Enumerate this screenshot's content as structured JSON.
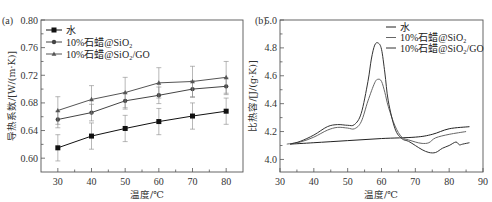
{
  "chart_data": [
    {
      "type": "line",
      "panel_label": "(a)",
      "title": "",
      "xlabel": "温度/℃",
      "ylabel": "导热系数/[W/(m·K)]",
      "xlim": [
        25,
        85
      ],
      "ylim": [
        0.58,
        0.8
      ],
      "x_ticks": [
        30,
        40,
        50,
        60,
        70,
        80
      ],
      "y_ticks": [
        0.6,
        0.64,
        0.68,
        0.72,
        0.76,
        0.8
      ],
      "y_tick_labels": [
        "0.60",
        "0.64",
        "0.68",
        "0.72",
        "0.76",
        "0.80"
      ],
      "legend_position": "top-left",
      "grid": false,
      "x": [
        30,
        40,
        50,
        60,
        70,
        80
      ],
      "series": [
        {
          "name": "水",
          "marker": "square",
          "values": [
            0.615,
            0.632,
            0.643,
            0.653,
            0.661,
            0.668
          ],
          "error": [
            0.019,
            0.019,
            0.019,
            0.019,
            0.019,
            0.019
          ]
        },
        {
          "name": "10%石蜡@SiO₂",
          "marker": "circle",
          "values": [
            0.656,
            0.666,
            0.683,
            0.691,
            0.7,
            0.704
          ],
          "error": [
            0.012,
            0.012,
            0.012,
            0.012,
            0.012,
            0.012
          ]
        },
        {
          "name": "10%石蜡@SiO₂/GO",
          "marker": "triangle",
          "values": [
            0.669,
            0.685,
            0.695,
            0.709,
            0.711,
            0.717
          ],
          "error": [
            0.02,
            0.02,
            0.022,
            0.022,
            0.022,
            0.023
          ]
        }
      ]
    },
    {
      "type": "line",
      "panel_label": "(b)",
      "title": "",
      "xlabel": "温度/℃",
      "ylabel": "比热容/[J/(g·K)]",
      "xlim": [
        30,
        90
      ],
      "ylim": [
        3.91,
        5.0
      ],
      "x_ticks": [
        30,
        40,
        50,
        60,
        70,
        80,
        90
      ],
      "y_ticks": [
        4.0,
        4.2,
        4.4,
        4.6,
        4.8,
        5.0
      ],
      "y_tick_labels": [
        "4.0",
        "4.2",
        "4.4",
        "4.6",
        "4.8",
        "5.0"
      ],
      "legend_position": "top-right",
      "grid": false,
      "series": [
        {
          "name": "水",
          "x": [
            33,
            40,
            50,
            60,
            70,
            75,
            80,
            86
          ],
          "values": [
            4.11,
            4.12,
            4.135,
            4.15,
            4.16,
            4.18,
            4.22,
            4.235
          ]
        },
        {
          "name": "10%石蜡@SiO₂",
          "x": [
            32,
            36,
            40,
            44,
            47,
            50,
            52,
            54,
            56,
            58,
            59,
            60,
            61,
            62,
            64,
            66,
            68,
            70,
            72,
            74,
            76,
            80,
            85
          ],
          "values": [
            4.11,
            4.125,
            4.16,
            4.21,
            4.23,
            4.225,
            4.22,
            4.27,
            4.42,
            4.55,
            4.575,
            4.56,
            4.48,
            4.38,
            4.24,
            4.16,
            4.14,
            4.125,
            4.115,
            4.12,
            4.155,
            4.18,
            4.2
          ]
        },
        {
          "name": "10%石蜡@SiO₂/GO",
          "x": [
            33,
            36,
            40,
            44,
            47,
            50,
            52,
            54,
            56,
            57,
            58,
            59,
            60,
            61,
            62,
            64,
            66,
            68,
            70,
            72,
            74,
            76,
            78,
            80,
            82,
            83,
            84,
            86
          ],
          "values": [
            4.11,
            4.13,
            4.175,
            4.235,
            4.25,
            4.245,
            4.25,
            4.33,
            4.56,
            4.72,
            4.82,
            4.835,
            4.79,
            4.62,
            4.42,
            4.22,
            4.15,
            4.13,
            4.1,
            4.07,
            4.05,
            4.05,
            4.08,
            4.1,
            4.125,
            4.105,
            4.11,
            4.12
          ]
        }
      ]
    }
  ]
}
